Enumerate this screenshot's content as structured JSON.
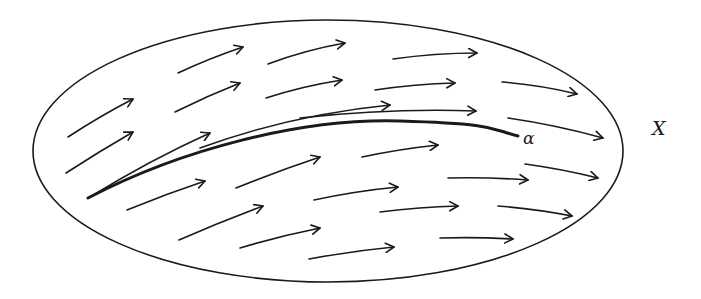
{
  "diagram": {
    "type": "vector-field-on-manifold",
    "colors": {
      "background": "#ffffff",
      "stroke": "#1a1a1a"
    },
    "region": {
      "name": "X",
      "shape": "ellipse",
      "cx": 328,
      "cy": 151,
      "rx": 295,
      "ry": 131
    },
    "curve": {
      "name": "α",
      "path": "M 88 198 C 180 150, 300 118, 400 121 S 490 129, 518 136",
      "stroke_width": 3
    },
    "labels": {
      "curve_label": "α",
      "region_label": "X",
      "curve_label_pos": {
        "x": 523,
        "y": 130
      },
      "region_label_pos": {
        "x": 652,
        "y": 119
      }
    },
    "arrows": [
      {
        "d": "M 178 73 Q 210 58 243 47",
        "head": [
          243,
          47
        ]
      },
      {
        "d": "M 268 64 Q 305 50 345 43",
        "head": [
          345,
          43
        ]
      },
      {
        "d": "M 393 59 Q 435 53 477 53",
        "head": [
          477,
          53
        ]
      },
      {
        "d": "M 68 137 Q 100 116 133 99",
        "head": [
          133,
          99
        ]
      },
      {
        "d": "M 175 112 Q 207 96 240 83",
        "head": [
          240,
          83
        ]
      },
      {
        "d": "M 266 98 Q 303 86 342 80",
        "head": [
          342,
          80
        ]
      },
      {
        "d": "M 375 90 Q 415 84 455 83",
        "head": [
          455,
          83
        ]
      },
      {
        "d": "M 502 82 Q 540 85 577 94",
        "head": [
          577,
          94
        ]
      },
      {
        "d": "M 66 173 Q 100 151 133 132",
        "head": [
          133,
          132
        ]
      },
      {
        "d": "M 90 197 Q 150 160 210 133",
        "head": [
          210,
          133
        ]
      },
      {
        "d": "M 200 148 Q 290 115 390 105",
        "head": [
          390,
          105
        ]
      },
      {
        "d": "M 300 118 Q 390 108 476 111",
        "head": [
          476,
          111
        ]
      },
      {
        "d": "M 508 118 Q 556 125 603 138",
        "head": [
          603,
          138
        ]
      },
      {
        "d": "M 127 210 Q 166 194 205 181",
        "head": [
          205,
          181
        ]
      },
      {
        "d": "M 236 188 Q 278 171 320 157",
        "head": [
          320,
          157
        ]
      },
      {
        "d": "M 362 157 Q 400 149 438 145",
        "head": [
          438,
          145
        ]
      },
      {
        "d": "M 525 164 Q 562 169 598 178",
        "head": [
          598,
          178
        ]
      },
      {
        "d": "M 314 200 Q 356 191 398 187",
        "head": [
          398,
          187
        ]
      },
      {
        "d": "M 448 178 Q 488 177 528 180",
        "head": [
          528,
          180
        ]
      },
      {
        "d": "M 179 240 Q 220 222 263 206",
        "head": [
          263,
          206
        ]
      },
      {
        "d": "M 240 248 Q 280 236 320 228",
        "head": [
          320,
          228
        ]
      },
      {
        "d": "M 380 212 Q 420 207 458 206",
        "head": [
          458,
          206
        ]
      },
      {
        "d": "M 498 206 Q 536 209 572 216",
        "head": [
          572,
          216
        ]
      },
      {
        "d": "M 309 259 Q 352 251 394 247",
        "head": [
          394,
          247
        ]
      },
      {
        "d": "M 440 238 Q 477 237 513 239",
        "head": [
          513,
          239
        ]
      }
    ]
  }
}
